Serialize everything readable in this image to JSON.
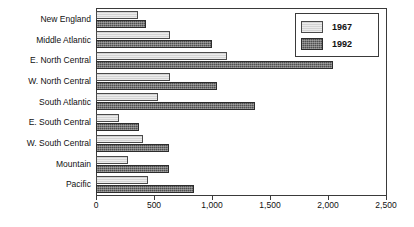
{
  "chart_data": {
    "type": "bar",
    "orientation": "horizontal",
    "title": "",
    "xlabel": "",
    "ylabel": "",
    "xlim": [
      0,
      2500
    ],
    "grid": false,
    "legend_position": "top-right",
    "categories": [
      "New England",
      "Middle Atlantic",
      "E. North Central",
      "W. North Central",
      "South Atlantic",
      "E. South Central",
      "W. South Central",
      "Mountain",
      "Pacific"
    ],
    "xticks": [
      0,
      500,
      1000,
      1500,
      2000,
      2500
    ],
    "xticklabels": [
      "0",
      "500",
      "1,000",
      "1,500",
      "2,000",
      "2,500"
    ],
    "series": [
      {
        "name": "1967",
        "color": "#d4d4d4",
        "values": [
          360,
          640,
          1130,
          640,
          535,
          195,
          405,
          280,
          450
        ]
      },
      {
        "name": "1992",
        "color": "#4f4f4f",
        "values": [
          430,
          1000,
          2040,
          1045,
          1370,
          370,
          630,
          625,
          845
        ]
      }
    ]
  },
  "legend": {
    "entries": [
      {
        "label": "1967"
      },
      {
        "label": "1992"
      }
    ]
  }
}
